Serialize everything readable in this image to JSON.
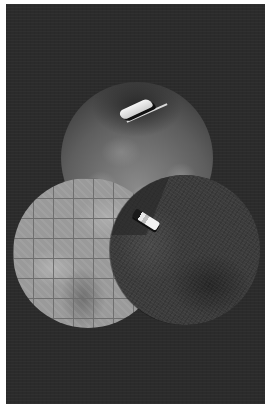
{
  "artwork": {
    "description": "Collage of three overlapping circles on a dark charcoal background with a white border",
    "background_color": "#2b2b2b",
    "border_color": "#ffffff",
    "circles": [
      {
        "name": "top",
        "texture": "cloudy light and dark organic texture",
        "object": "white elongated flake/shape",
        "tone": "#8a8a8a"
      },
      {
        "name": "left",
        "texture": "light gray grid over soft shapes",
        "tone": "#9a9a9a"
      },
      {
        "name": "right",
        "texture": "dark speckled noise",
        "object": "small white capsule/cylinder",
        "tone": "#3c3c3c"
      }
    ]
  }
}
